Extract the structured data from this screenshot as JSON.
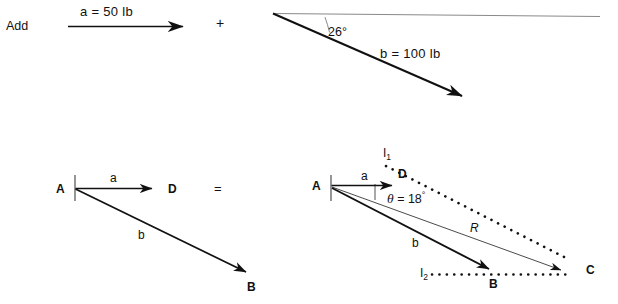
{
  "figure": {
    "title_word": "Add",
    "operator_plus": "+",
    "operator_equals": "=",
    "footer_note": ""
  },
  "top_row": {
    "vector_a": {
      "label": "a = 50 lb",
      "magnitude": 50,
      "unit": "lb",
      "name": "a",
      "direction_deg": 0
    },
    "vector_b": {
      "label": "b = 100 lb",
      "magnitude": 100,
      "unit": "lb",
      "name": "b",
      "direction_deg": -26
    },
    "angle": {
      "value": "26°",
      "degrees": 26
    }
  },
  "bottom_left": {
    "points": {
      "A": "A",
      "D": "D",
      "B": "B"
    },
    "vectors": {
      "a": "a",
      "b": "b"
    }
  },
  "bottom_right": {
    "points": {
      "A": "A",
      "D": "D",
      "B": "B",
      "C": "C"
    },
    "vectors": {
      "a": "a",
      "b": "b",
      "R": "R"
    },
    "construction_lines": {
      "l1": "I",
      "l1_sub": "1",
      "l2": "I",
      "l2_sub": "2"
    },
    "angle": {
      "label_theta": "θ",
      "label_eq": "=",
      "value": "18",
      "degree_sign": "°",
      "degrees": 18
    }
  },
  "colors": {
    "ink": "#111111",
    "thin_line": "#5a5a5a",
    "background": "#ffffff"
  }
}
